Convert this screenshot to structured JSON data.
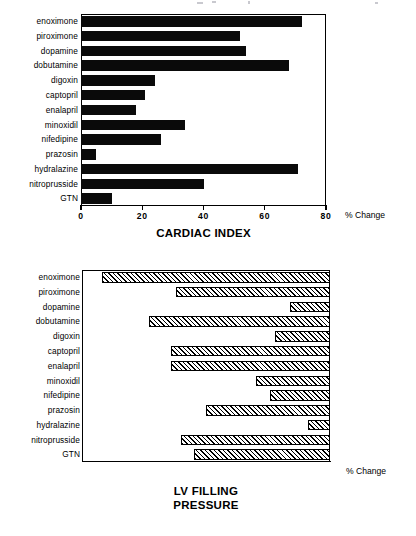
{
  "chart_data": [
    {
      "type": "bar",
      "orientation": "horizontal",
      "title": "CARDIAC INDEX",
      "xlabel": "% Change",
      "ylabel": "",
      "xlim": [
        0,
        80
      ],
      "xticks": [
        0,
        20,
        40,
        60,
        80
      ],
      "xtick_labels": [
        "0",
        "20",
        "40",
        "60",
        "80"
      ],
      "grid": false,
      "legend": "none",
      "bar_style": "solid-black",
      "categories": [
        "enoximone",
        "piroximone",
        "dopamine",
        "dobutamine",
        "digoxin",
        "captopril",
        "enalapril",
        "minoxidil",
        "nifedipine",
        "prazosin",
        "hydralazine",
        "nitroprusside",
        "GTN"
      ],
      "values": [
        72,
        52,
        54,
        68,
        24,
        21,
        18,
        34,
        26,
        5,
        71,
        40,
        10
      ]
    },
    {
      "type": "bar",
      "orientation": "horizontal",
      "title": "LV FILLING PRESSURE",
      "title_lines": [
        "LV FILLING",
        "PRESSURE"
      ],
      "xlabel": "% Change",
      "ylabel": "",
      "xlim": [
        -50,
        0
      ],
      "xticks": [
        -50,
        -40,
        -30,
        -20,
        -10,
        0
      ],
      "xtick_labels": [
        "-50",
        "-40",
        "-30",
        "-20",
        "-10",
        "0"
      ],
      "grid": false,
      "legend": "none",
      "bar_style": "diagonal-hatch",
      "categories": [
        "enoximone",
        "piroximone",
        "dopamine",
        "dobutamine",
        "digoxin",
        "captopril",
        "enalapril",
        "minoxidil",
        "nifedipine",
        "prazosin",
        "hydralazine",
        "nitroprusside",
        "GTN"
      ],
      "values": [
        -46,
        -31,
        -8,
        -36.5,
        -11,
        -32,
        -32,
        -15,
        -12,
        -25,
        -4.5,
        -30,
        -27.5
      ]
    }
  ]
}
